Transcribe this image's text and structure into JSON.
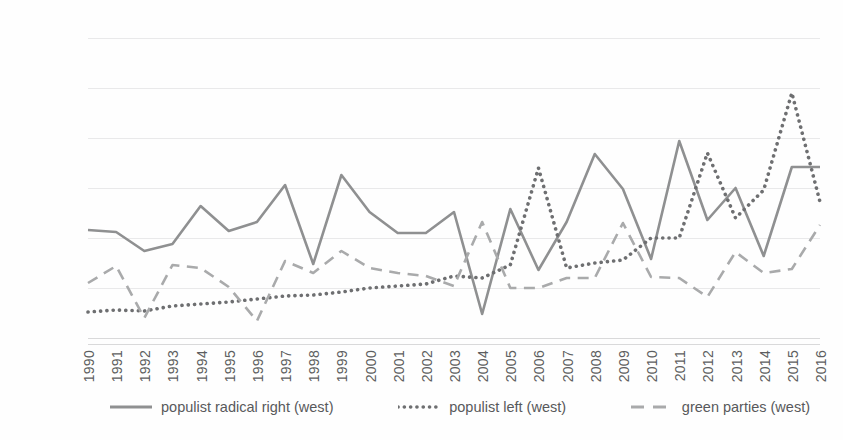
{
  "chart_data": {
    "type": "line",
    "title": "",
    "xlabel": "",
    "ylabel": "",
    "ylim": [
      0,
      30
    ],
    "ytick_step": 5,
    "grid": true,
    "legend_position": "bottom",
    "categories": [
      "1990",
      "1991",
      "1992",
      "1993",
      "1994",
      "1995",
      "1996",
      "1997",
      "1998",
      "1999",
      "2000",
      "2001",
      "2002",
      "2003",
      "2004",
      "2005",
      "2006",
      "2007",
      "2008",
      "2009",
      "2010",
      "2011",
      "2012",
      "2013",
      "2014",
      "2015",
      "2016"
    ],
    "series": [
      {
        "name": "populist radical right (west)",
        "style": "solid",
        "color": "#8f9091",
        "values": [
          10.8,
          10.6,
          8.7,
          9.4,
          13.2,
          10.7,
          11.6,
          15.3,
          7.4,
          16.3,
          12.6,
          10.5,
          10.5,
          12.6,
          2.4,
          12.9,
          6.8,
          11.6,
          18.4,
          14.9,
          7.9,
          19.7,
          11.8,
          15.0,
          8.2,
          17.1,
          17.1
        ]
      },
      {
        "name": "populist left (west)",
        "style": "dotted",
        "color": "#6e6f71",
        "values": [
          2.6,
          2.8,
          2.7,
          3.2,
          3.4,
          3.6,
          3.9,
          4.2,
          4.3,
          4.6,
          5.0,
          5.2,
          5.4,
          6.2,
          6.0,
          7.3,
          17.0,
          7.0,
          7.5,
          7.8,
          10.0,
          10.0,
          18.5,
          12.0,
          14.8,
          24.5,
          13.6
        ]
      },
      {
        "name": "green parties (west)",
        "style": "dashed",
        "color": "#a9aaab",
        "values": [
          5.5,
          7.2,
          2.0,
          7.3,
          7.0,
          5.1,
          1.7,
          7.7,
          6.5,
          8.7,
          7.0,
          6.5,
          6.2,
          5.2,
          11.6,
          5.0,
          5.0,
          6.0,
          6.0,
          11.5,
          6.1,
          6.0,
          4.1,
          8.6,
          6.5,
          6.9,
          11.3
        ]
      }
    ],
    "ytick_labels": [
      "0.00",
      "5.00",
      "10.00",
      "15.00",
      "20.00",
      "25.00",
      "30.00"
    ]
  },
  "legend": {
    "items": [
      {
        "label": "populist radical right (west)",
        "style": "solid"
      },
      {
        "label": "populist left (west)",
        "style": "dotted"
      },
      {
        "label": "green parties (west)",
        "style": "dashed"
      }
    ]
  }
}
